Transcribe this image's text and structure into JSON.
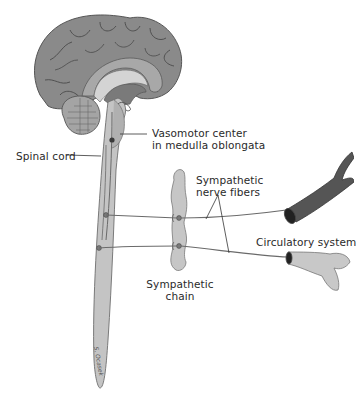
{
  "diagram": {
    "type": "anatomical illustration",
    "labels": {
      "vasomotor_line1": "Vasomotor center",
      "vasomotor_line2": "in medulla oblongata",
      "spinal_cord": "Spinal cord",
      "nerve_fibers_line1": "Sympathetic",
      "nerve_fibers_line2": "nerve fibers",
      "circulatory": "Circulatory system",
      "chain_line1": "Sympathetic",
      "chain_line2": "chain"
    },
    "signature": "S. Ocasek",
    "colors": {
      "brain": "#8a8a8a",
      "brain_outline": "#555555",
      "brain_inner": "#b8b8b8",
      "cord": "#c4c4c4",
      "cord_outline": "#6e6e6e",
      "nerve": "#6a6a6a",
      "vessel_dark": "#5a5a5a",
      "vessel_light": "#c8c8c8",
      "text": "#2a2a2a"
    }
  }
}
